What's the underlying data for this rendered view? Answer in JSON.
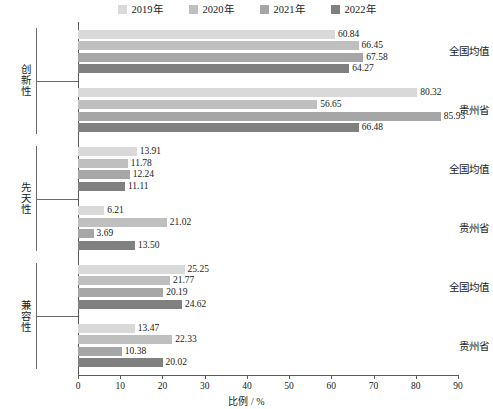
{
  "chart_data": {
    "type": "bar",
    "orientation": "horizontal",
    "title": "",
    "xlabel": "比例 / %",
    "ylabel": "",
    "xlim": [
      0,
      90
    ],
    "xticks": [
      0,
      10,
      20,
      30,
      40,
      50,
      60,
      70,
      80,
      90
    ],
    "grid": false,
    "legend_position": "top-center",
    "series": [
      {
        "name": "2019年",
        "color": "#d9d9d9"
      },
      {
        "name": "2020年",
        "color": "#bfbfbf"
      },
      {
        "name": "2021年",
        "color": "#a6a6a6"
      },
      {
        "name": "2022年",
        "color": "#808080"
      }
    ],
    "groups": [
      {
        "name": "创新性",
        "subgroups": [
          {
            "name": "全国均值",
            "values": [
              60.84,
              66.45,
              67.58,
              64.27
            ]
          },
          {
            "name": "贵州省",
            "values": [
              80.32,
              56.65,
              85.93,
              66.48
            ]
          }
        ]
      },
      {
        "name": "先天性",
        "subgroups": [
          {
            "name": "全国均值",
            "values": [
              13.91,
              11.78,
              12.24,
              11.11
            ]
          },
          {
            "name": "贵州省",
            "values": [
              6.21,
              21.02,
              3.69,
              13.5
            ]
          }
        ]
      },
      {
        "name": "兼容性",
        "subgroups": [
          {
            "name": "全国均值",
            "values": [
              25.25,
              21.77,
              20.19,
              24.62
            ]
          },
          {
            "name": "贵州省",
            "values": [
              13.47,
              22.33,
              10.38,
              20.02
            ]
          }
        ]
      }
    ],
    "value_labels": [
      "60.84",
      "66.45",
      "67.58",
      "64.27",
      "80.32",
      "56.65",
      "85.93",
      "66.48",
      "13.91",
      "11.78",
      "12.24",
      "11.11",
      "6.21",
      "21.02",
      "3.69",
      "13.50",
      "25.25",
      "21.77",
      "20.19",
      "24.62",
      "13.47",
      "22.33",
      "10.38",
      "20.02"
    ]
  },
  "legend": {
    "items": [
      {
        "label": "2019年",
        "color": "#d9d9d9"
      },
      {
        "label": "2020年",
        "color": "#bfbfbf"
      },
      {
        "label": "2021年",
        "color": "#a6a6a6"
      },
      {
        "label": "2022年",
        "color": "#808080"
      }
    ]
  },
  "axis": {
    "x_title": "比例 / %",
    "x_tick_labels": [
      "0",
      "10",
      "20",
      "30",
      "40",
      "50",
      "60",
      "70",
      "80",
      "90"
    ]
  }
}
